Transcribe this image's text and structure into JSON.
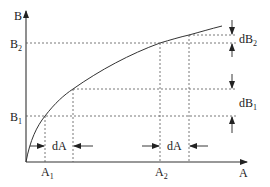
{
  "diagram": {
    "type": "curve-with-differentials",
    "axes": {
      "y_label": "B",
      "x_label": "A"
    },
    "y_ticks": [
      {
        "base": "B",
        "sub": "2",
        "y": 43
      },
      {
        "base": "B",
        "sub": "1",
        "y": 116
      }
    ],
    "x_ticks": [
      {
        "base": "A",
        "sub": "1",
        "x": 45
      },
      {
        "base": "A",
        "sub": "2",
        "x": 160
      }
    ],
    "intervals": {
      "dA_left": {
        "label": "dA"
      },
      "dA_right": {
        "label": "dA"
      },
      "dB_upper": {
        "base": "dB",
        "sub": "2"
      },
      "dB_lower": {
        "base": "dB",
        "sub": "1"
      }
    },
    "colors": {
      "line": "#333333",
      "dashed": "#555555",
      "background": "#ffffff"
    }
  }
}
